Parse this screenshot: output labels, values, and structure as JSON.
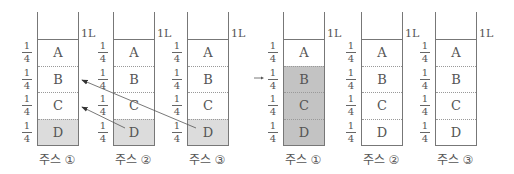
{
  "volume_label": "1L",
  "fraction": {
    "num": "1",
    "den": "4"
  },
  "cell_letters": [
    "A",
    "B",
    "C",
    "D"
  ],
  "colors": {
    "gray_light": "#dcdcdc",
    "gray_dark": "#c3c3c3",
    "line": "#777777"
  },
  "before": {
    "containers": [
      {
        "label": "주스 ①",
        "shaded": [
          "D"
        ]
      },
      {
        "label": "주스 ②",
        "shaded": [
          "D"
        ]
      },
      {
        "label": "주스 ③",
        "shaded": [
          "D"
        ]
      }
    ],
    "arrows": [
      {
        "from": "주스 ② D",
        "to": "주스 ① C"
      },
      {
        "from": "주스 ③ D",
        "to": "주스 ① B"
      }
    ]
  },
  "transition_arrow": "→",
  "after": {
    "containers": [
      {
        "label": "주스 ①",
        "shaded": [
          "B",
          "C",
          "D"
        ]
      },
      {
        "label": "주스 ②",
        "shaded": []
      },
      {
        "label": "주스 ③",
        "shaded": []
      }
    ]
  }
}
